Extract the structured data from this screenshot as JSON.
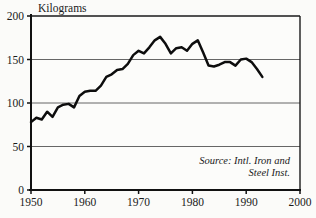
{
  "chart_data": {
    "type": "line",
    "title": "",
    "subtitle": "",
    "xlabel": "",
    "ylabel": "Kilograms",
    "ylabel_position": "top-left",
    "xlim": [
      1950,
      2000
    ],
    "ylim": [
      0,
      200
    ],
    "grid": true,
    "grid_axis": "y",
    "legend": "none",
    "line_color": "#0d0d0d",
    "background_color": "#fbfbf9",
    "y_ticks": [
      0,
      50,
      100,
      150,
      200
    ],
    "y_tick_labels": [
      "0",
      "50",
      "100",
      "150",
      "200"
    ],
    "x_ticks": [
      1950,
      1960,
      1970,
      1980,
      1990,
      2000
    ],
    "x_tick_labels": [
      "1950",
      "1960",
      "1970",
      "1980",
      "1990",
      "2000"
    ],
    "annotations": [
      {
        "name": "source-note",
        "line1": "Source: Intl. Iron and",
        "line2": "Steel Inst.",
        "style": "italic",
        "position": "bottom-right-inside-plot"
      }
    ],
    "series": [
      {
        "name": "Steel consumption per capita",
        "x": [
          1950,
          1951,
          1952,
          1953,
          1954,
          1955,
          1956,
          1957,
          1958,
          1959,
          1960,
          1961,
          1962,
          1963,
          1964,
          1965,
          1966,
          1967,
          1968,
          1969,
          1970,
          1971,
          1972,
          1973,
          1974,
          1975,
          1976,
          1977,
          1978,
          1979,
          1980,
          1981,
          1982,
          1983,
          1984,
          1985,
          1986,
          1987,
          1988,
          1989,
          1990,
          1991,
          1992,
          1993
        ],
        "values": [
          78,
          83,
          81,
          90,
          84,
          95,
          98,
          99,
          95,
          108,
          113,
          114,
          114,
          120,
          130,
          133,
          138,
          139,
          145,
          155,
          160,
          157,
          164,
          172,
          176,
          168,
          157,
          163,
          164,
          160,
          168,
          172,
          158,
          143,
          142,
          144,
          147,
          147,
          143,
          150,
          151,
          147,
          139,
          130
        ]
      }
    ]
  },
  "axis": {
    "y_label": "Kilograms"
  },
  "source": {
    "line1": "Source: Intl. Iron and",
    "line2": "Steel Inst."
  }
}
